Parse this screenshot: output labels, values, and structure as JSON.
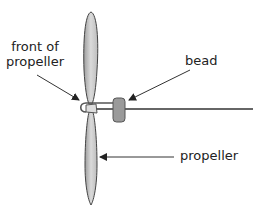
{
  "diagram": {
    "labels": {
      "front_line1": "front of",
      "front_line2": "propeller",
      "bead": "bead",
      "propeller": "propeller"
    },
    "colors": {
      "blade_fill": "#c8c8c8",
      "blade_stroke": "#555555",
      "bead_fill": "#9a9a9a",
      "shaft": "#666666",
      "arrow": "#333333",
      "text": "#222222"
    },
    "parts": [
      "propeller-blade-top",
      "propeller-blade-bottom",
      "hub-loop",
      "bead",
      "shaft"
    ]
  }
}
